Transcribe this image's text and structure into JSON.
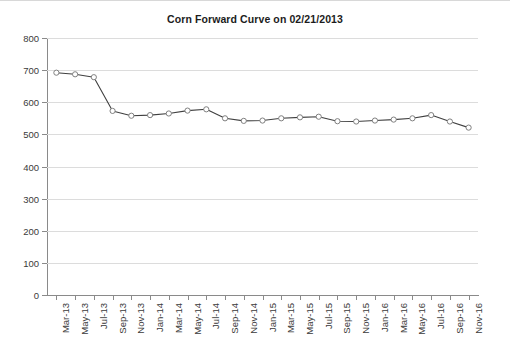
{
  "chart_data": {
    "type": "line",
    "title": "Corn Forward Curve on 02/21/2013",
    "xlabel": "",
    "ylabel": "",
    "ylim": [
      0,
      800
    ],
    "ytick_step": 100,
    "yticks": [
      "0",
      "100",
      "200",
      "300",
      "400",
      "500",
      "600",
      "700",
      "800"
    ],
    "grid": true,
    "legend": "none",
    "marker": "open-circle",
    "line_color": "#404040",
    "marker_color": "#808080",
    "categories": [
      "Mar-13",
      "May-13",
      "Jul-13",
      "Sep-13",
      "Nov-13",
      "Jan-14",
      "Mar-14",
      "May-14",
      "Jul-14",
      "Sep-14",
      "Nov-14",
      "Jan-15",
      "Mar-15",
      "May-15",
      "Jul-15",
      "Sep-15",
      "Nov-15",
      "Jan-16",
      "Mar-16",
      "May-16",
      "Jul-16",
      "Sep-16",
      "Nov-16"
    ],
    "values": [
      692,
      687,
      678,
      573,
      558,
      560,
      565,
      574,
      578,
      550,
      542,
      543,
      550,
      553,
      555,
      541,
      540,
      543,
      546,
      550,
      560,
      540,
      521
    ]
  }
}
